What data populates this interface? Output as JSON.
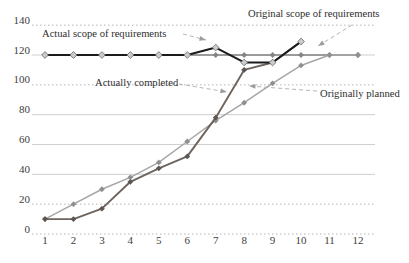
{
  "page": {
    "background": "#ffffff"
  },
  "chart_data": {
    "type": "line",
    "title": "",
    "xlabel": "",
    "ylabel": "",
    "x_categories": [
      "1",
      "2",
      "3",
      "4",
      "5",
      "6",
      "7",
      "8",
      "9",
      "10",
      "11",
      "12"
    ],
    "ylim": [
      0,
      140
    ],
    "yticks": [
      0,
      20,
      40,
      60,
      80,
      100,
      120,
      140
    ],
    "dotted_yticks": [
      0,
      20,
      100,
      140
    ],
    "grid": true,
    "legend_position": "inline-annotations",
    "series": [
      {
        "name": "Original scope of requirements",
        "x": [
          1,
          2,
          3,
          4,
          5,
          6,
          7,
          8,
          9,
          10,
          11,
          12
        ],
        "values": [
          120,
          120,
          120,
          120,
          120,
          120,
          120,
          120,
          120,
          120,
          120,
          120
        ],
        "color": "#9b9b9b",
        "width": 2.2,
        "marker": "diamond",
        "marker_color": "#858585",
        "marker_stroke": "none"
      },
      {
        "name": "Originally planned",
        "x": [
          1,
          2,
          3,
          4,
          5,
          6,
          7,
          8,
          9,
          10,
          11,
          12
        ],
        "values": [
          10,
          20,
          30,
          38,
          48,
          62,
          76,
          88,
          101,
          113,
          120,
          120
        ],
        "color": "#a6a6a6",
        "width": 1.5,
        "marker": "diamond",
        "marker_color": "#909090",
        "marker_stroke": "none"
      },
      {
        "name": "Actually completed",
        "x": [
          1,
          2,
          3,
          4,
          5,
          6,
          7,
          8,
          9,
          10
        ],
        "values": [
          10,
          10,
          17,
          35,
          44,
          52,
          78,
          110,
          115,
          129
        ],
        "color": "#6d645e",
        "width": 1.9,
        "marker": "diamond",
        "marker_color": "#5d5550",
        "marker_stroke": "none"
      },
      {
        "name": "Actual scope of requirements",
        "x": [
          1,
          2,
          3,
          4,
          5,
          6,
          7,
          8,
          9,
          10
        ],
        "values": [
          120,
          120,
          120,
          120,
          120,
          120,
          125,
          115,
          115,
          129
        ],
        "color": "#1b1b1b",
        "width": 2,
        "marker": "diamond",
        "marker_color": "#cbcbcb",
        "marker_stroke": "#6b6b6b"
      }
    ],
    "annotations": [
      {
        "id": "actual-scope-label",
        "text": "Actual scope of requirements",
        "x": 42,
        "y": 37,
        "leader": {
          "x1": 183,
          "y1": 34,
          "x2": 206,
          "y2": 40
        }
      },
      {
        "id": "original-scope-label",
        "text": "Original scope of requirements",
        "x": 248,
        "y": 17,
        "leader": {
          "x1": 352,
          "y1": 25,
          "x2": 318,
          "y2": 46
        }
      },
      {
        "id": "actually-completed-label",
        "text": "Actually completed",
        "x": 95,
        "y": 86,
        "leader": {
          "x1": 179,
          "y1": 84,
          "x2": 227,
          "y2": 92
        }
      },
      {
        "id": "originally-planned-label",
        "text": "Originally planned",
        "x": 320,
        "y": 97,
        "leader": {
          "x1": 317,
          "y1": 91,
          "x2": 249,
          "y2": 86
        }
      }
    ]
  }
}
